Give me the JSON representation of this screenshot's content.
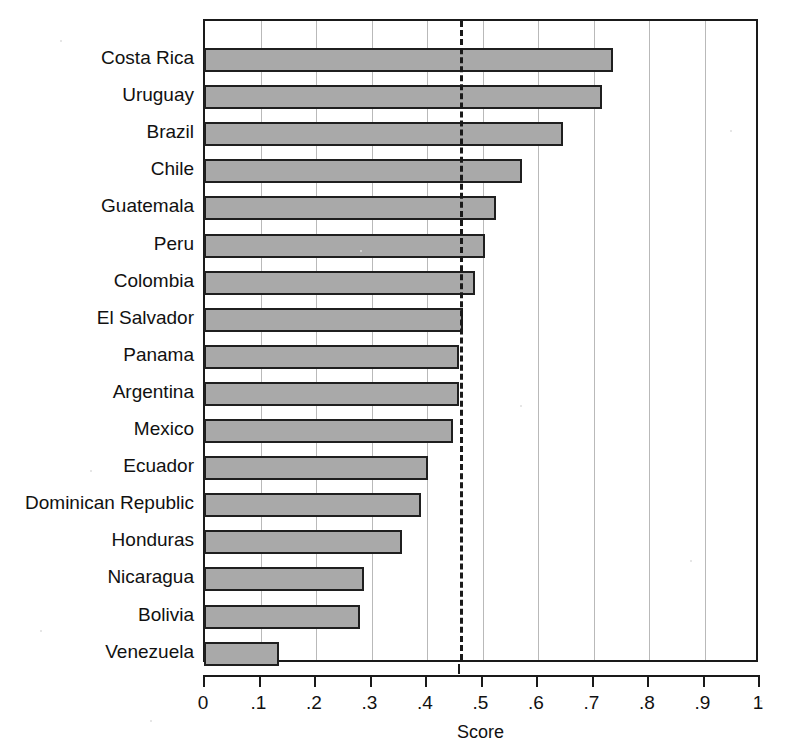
{
  "chart_data": {
    "type": "bar",
    "orientation": "horizontal",
    "title": "",
    "xlabel": "Score",
    "ylabel": "",
    "xlim": [
      0,
      1
    ],
    "ylim": null,
    "grid": true,
    "gridlines_axis": "x",
    "legend": null,
    "categories": [
      "Costa Rica",
      "Uruguay",
      "Brazil",
      "Chile",
      "Guatemala",
      "Peru",
      "Colombia",
      "El Salvador",
      "Panama",
      "Argentina",
      "Mexico",
      "Ecuador",
      "Dominican Republic",
      "Honduras",
      "Nicaragua",
      "Bolivia",
      "Venezuela"
    ],
    "values": [
      0.735,
      0.715,
      0.645,
      0.572,
      0.525,
      0.505,
      0.487,
      0.464,
      0.458,
      0.457,
      0.446,
      0.402,
      0.39,
      0.355,
      0.287,
      0.28,
      0.134
    ],
    "xticks": [
      0,
      0.1,
      0.2,
      0.3,
      0.4,
      0.5,
      0.6,
      0.7,
      0.8,
      0.9,
      1
    ],
    "xticklabels": [
      "0",
      ".1",
      ".2",
      ".3",
      ".4",
      ".5",
      ".6",
      ".7",
      ".8",
      ".9",
      "1"
    ],
    "annotations": [
      {
        "name": "mean-reference-line",
        "type": "vline",
        "style": "dashed",
        "value": 0.459,
        "label": ""
      }
    ],
    "colors": {
      "bar_fill": "#a9a9a9",
      "bar_edge": "#1f1f1f",
      "gridline": "#b9b9b9",
      "axis": "#1a1a1a",
      "text": "#111111",
      "background": "#ffffff"
    }
  }
}
